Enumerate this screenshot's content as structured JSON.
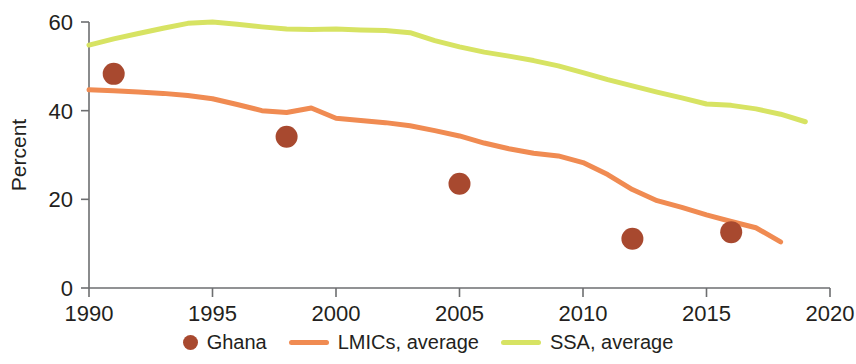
{
  "chart_data": {
    "type": "line",
    "title": "",
    "subtitle": "",
    "xlabel": "",
    "ylabel": "Percent",
    "xlim": [
      1990,
      2020
    ],
    "ylim": [
      0,
      60
    ],
    "xticks": [
      1990,
      1995,
      2000,
      2005,
      2010,
      2015,
      2020
    ],
    "xtick_labels": [
      "1990",
      "1995",
      "2000",
      "2005",
      "2010",
      "2015",
      "2020"
    ],
    "yticks": [
      0,
      20,
      40,
      60
    ],
    "ytick_labels": [
      "0",
      "20",
      "40",
      "60"
    ],
    "grid": false,
    "legend_position": "bottom",
    "colors": {
      "ghana": "#a8492f",
      "lmics": "#f08b52",
      "ssa": "#d7e363",
      "axis": "#6d6e70",
      "text": "#231f20"
    },
    "series": [
      {
        "name": "Ghana",
        "marker": "circle",
        "style": "scatter",
        "color": "#a8492f",
        "x": [
          1991,
          1998,
          2005,
          2012,
          2016
        ],
        "values": [
          48.3,
          34.1,
          23.5,
          11.1,
          12.6
        ]
      },
      {
        "name": "LMICs, average",
        "marker": "none",
        "style": "line",
        "color": "#f08b52",
        "x": [
          1990,
          1991,
          1992,
          1993,
          1994,
          1995,
          1996,
          1997,
          1998,
          1999,
          2000,
          2001,
          2002,
          2003,
          2004,
          2005,
          2006,
          2007,
          2008,
          2009,
          2010,
          2011,
          2012,
          2013,
          2014,
          2015,
          2016,
          2017,
          2018
        ],
        "values": [
          44.7,
          44.5,
          44.2,
          43.9,
          43.4,
          42.7,
          41.4,
          40.0,
          39.6,
          40.6,
          38.3,
          37.8,
          37.3,
          36.6,
          35.5,
          34.3,
          32.7,
          31.4,
          30.4,
          29.8,
          28.3,
          25.6,
          22.2,
          19.7,
          18.2,
          16.5,
          15.0,
          13.6,
          10.4
        ]
      },
      {
        "name": "SSA, average",
        "marker": "none",
        "style": "line",
        "color": "#d7e363",
        "x": [
          1990,
          1991,
          1992,
          1993,
          1994,
          1995,
          1996,
          1997,
          1998,
          1999,
          2000,
          2001,
          2002,
          2003,
          2004,
          2005,
          2006,
          2007,
          2008,
          2009,
          2010,
          2011,
          2012,
          2013,
          2014,
          2015,
          2016,
          2017,
          2018,
          2019
        ],
        "values": [
          54.8,
          56.2,
          57.4,
          58.6,
          59.7,
          60.0,
          59.5,
          58.9,
          58.4,
          58.3,
          58.4,
          58.2,
          58.1,
          57.6,
          55.8,
          54.4,
          53.2,
          52.3,
          51.3,
          50.1,
          48.6,
          47.0,
          45.6,
          44.2,
          42.9,
          41.5,
          41.2,
          40.4,
          39.2,
          37.5
        ]
      }
    ]
  },
  "axes": {
    "y_title": "Percent"
  },
  "legend": {
    "items": [
      {
        "label": "Ghana",
        "kind": "dot",
        "color": "#a8492f"
      },
      {
        "label": "LMICs, average",
        "kind": "line",
        "color": "#f08b52"
      },
      {
        "label": "SSA, average",
        "kind": "line",
        "color": "#d7e363"
      }
    ]
  }
}
